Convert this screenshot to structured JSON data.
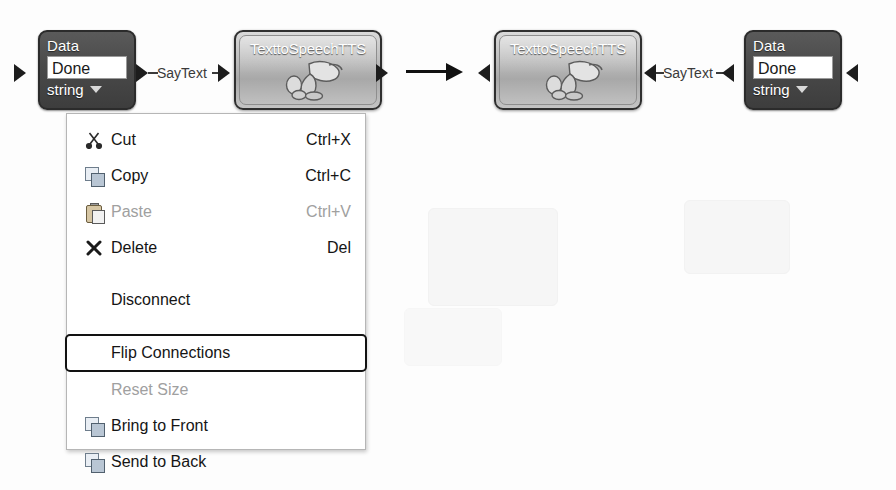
{
  "canvas": {
    "width": 896,
    "height": 490,
    "background": "#fdfdfd"
  },
  "graph_before": {
    "caption": "",
    "input_arrow_icon": "arrow-right-icon",
    "data_node": {
      "title": "Data",
      "value": "Done",
      "type": "string",
      "dropdown_icon": "caret-down-icon",
      "body_color": "#4a4a4a",
      "text_color": "#ffffff"
    },
    "connection": {
      "label": "SayText",
      "source_arrow_icon": "arrow-right-icon",
      "target_arrow_icon": "arrow-right-icon",
      "direction": "left-to-right"
    },
    "tts_node": {
      "title": "TexttoSpeechTTS",
      "icon": "megaphone-icon",
      "body_color": "#bdbdbd",
      "text_color": "#ffffff"
    },
    "output_arrow_icon": "arrow-right-icon"
  },
  "transform_arrow": {
    "icon": "arrow-right-icon",
    "color": "#111111"
  },
  "graph_after": {
    "input_arrow_icon": "arrow-left-icon",
    "tts_node": {
      "title": "TexttoSpeechTTS",
      "icon": "megaphone-icon",
      "body_color": "#bdbdbd",
      "text_color": "#ffffff"
    },
    "connection": {
      "label": "SayText",
      "source_arrow_icon": "arrow-left-icon",
      "target_arrow_icon": "arrow-left-icon",
      "direction": "right-to-left"
    },
    "data_node": {
      "title": "Data",
      "value": "Done",
      "type": "string",
      "dropdown_icon": "caret-down-icon",
      "body_color": "#4a4a4a",
      "text_color": "#ffffff"
    },
    "output_arrow_icon": "arrow-left-icon"
  },
  "context_menu": {
    "highlighted_item": "Flip Connections",
    "items": [
      {
        "label": "Cut",
        "shortcut": "Ctrl+X",
        "icon": "scissors-icon",
        "disabled": false,
        "highlighted": false
      },
      {
        "label": "Copy",
        "shortcut": "Ctrl+C",
        "icon": "copy-icon",
        "disabled": false,
        "highlighted": false
      },
      {
        "label": "Paste",
        "shortcut": "Ctrl+V",
        "icon": "paste-icon",
        "disabled": true,
        "highlighted": false
      },
      {
        "label": "Delete",
        "shortcut": "Del",
        "icon": "x-delete-icon",
        "disabled": false,
        "highlighted": false
      },
      {
        "label": "Disconnect",
        "shortcut": "",
        "icon": "",
        "disabled": false,
        "highlighted": false
      },
      {
        "label": "Flip Connections",
        "shortcut": "",
        "icon": "",
        "disabled": false,
        "highlighted": true
      },
      {
        "label": "Reset Size",
        "shortcut": "",
        "icon": "",
        "disabled": true,
        "highlighted": false
      },
      {
        "label": "Bring to Front",
        "shortcut": "",
        "icon": "layers-front-icon",
        "disabled": false,
        "highlighted": false
      },
      {
        "label": "Send to Back",
        "shortcut": "",
        "icon": "layers-back-icon",
        "disabled": false,
        "highlighted": false
      }
    ]
  }
}
